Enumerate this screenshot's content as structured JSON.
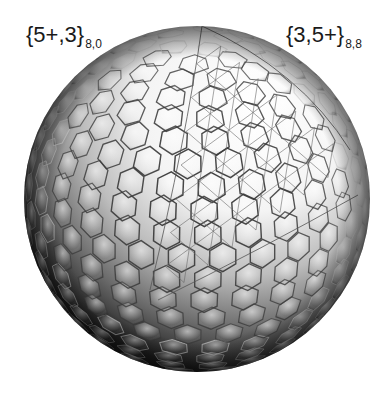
{
  "figure": {
    "labels": {
      "left": {
        "main": "{5+,3}",
        "subscript": "8,0"
      },
      "right": {
        "main": "{3,5+}",
        "subscript": "8,8"
      }
    },
    "sphere": {
      "center_x": 197,
      "center_y": 199,
      "radius": 173,
      "highlight_color": "#ffffff",
      "shadow_color": "#050505",
      "edge_color": "#3a3a3a"
    }
  }
}
